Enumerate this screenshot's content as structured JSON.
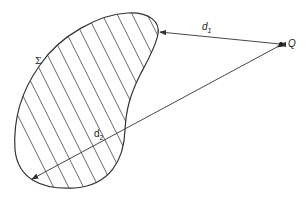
{
  "diagram": {
    "region_label": "Σ",
    "point_label": "Q",
    "distance_1": {
      "base": "d",
      "sub": "1"
    },
    "distance_2": {
      "base": "d",
      "sub": "2"
    },
    "colors": {
      "stroke": "#333333",
      "background": "#ffffff"
    }
  }
}
